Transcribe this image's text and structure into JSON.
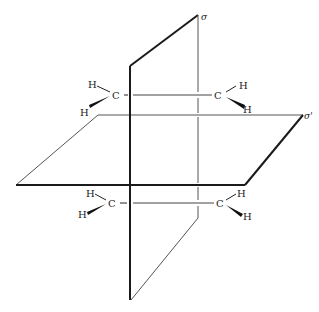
{
  "diagram": {
    "planes": {
      "sigma": {
        "label": "σ"
      },
      "sigma_prime": {
        "label": "σ'"
      }
    },
    "upper_molecule": {
      "left_carbon": "C",
      "right_carbon": "C",
      "h_upper_left": "H",
      "h_lower_left": "H",
      "h_upper_right": "H",
      "h_lower_right": "H"
    },
    "lower_molecule": {
      "left_carbon": "C",
      "right_carbon": "C",
      "h_upper_left": "H",
      "h_lower_left": "H",
      "h_upper_right": "H",
      "h_lower_right": "H"
    },
    "colors": {
      "line": "#1a1a1a",
      "thin_line": "#555555",
      "background": "#ffffff"
    }
  }
}
